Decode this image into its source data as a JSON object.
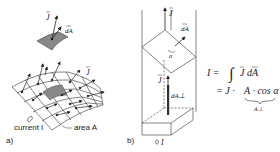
{
  "figure_a": {
    "panel_label": "a)",
    "vector_J": "J",
    "vector_dA": "dA",
    "vector_J_surface": "J",
    "label_current": "current I",
    "label_area": "area A",
    "surface_color": "#888888"
  },
  "figure_b": {
    "panel_label": "b)",
    "vector_J_top": "J",
    "vector_dA": "dA",
    "angle": "α",
    "vector_J_inner": "J",
    "vector_dA_perp": "dA⊥",
    "current_label": "I"
  },
  "equations": {
    "line1_lhs": "I =",
    "line1_integral": "∫",
    "line1_rhs": "J dA",
    "line2_prefix": "= J ·",
    "line2_term": "A · cos α",
    "line2_brace_label": "A⊥"
  }
}
